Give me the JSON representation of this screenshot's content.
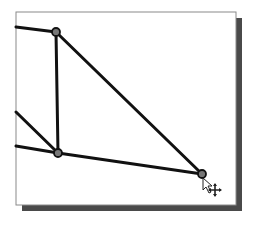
{
  "canvas": {
    "width": 255,
    "height": 227,
    "background": "#ffffff",
    "frame": {
      "x": 16,
      "y": 12,
      "width": 220,
      "height": 193,
      "stroke": "#8a8a8a"
    },
    "shadow": {
      "offset": 6,
      "color": "#4a4a4a"
    }
  },
  "sketch": {
    "line_color": "#111111",
    "line_width": 3,
    "nodes": [
      {
        "id": "A",
        "x": 56,
        "y": 32
      },
      {
        "id": "B",
        "x": 58,
        "y": 153
      },
      {
        "id": "C",
        "x": 202,
        "y": 174
      }
    ],
    "segments": [
      {
        "from": [
          16,
          27
        ],
        "to": [
          56,
          32
        ]
      },
      {
        "from": [
          56,
          32
        ],
        "to": [
          58,
          153
        ]
      },
      {
        "from": [
          56,
          32
        ],
        "to": [
          202,
          174
        ]
      },
      {
        "from": [
          58,
          153
        ],
        "to": [
          202,
          174
        ]
      },
      {
        "from": [
          16,
          112
        ],
        "to": [
          58,
          153
        ]
      },
      {
        "from": [
          16,
          146
        ],
        "to": [
          58,
          153
        ]
      }
    ]
  },
  "cursor": {
    "icon": "arrow-move-cursor-icon",
    "x": 203,
    "y": 178
  }
}
